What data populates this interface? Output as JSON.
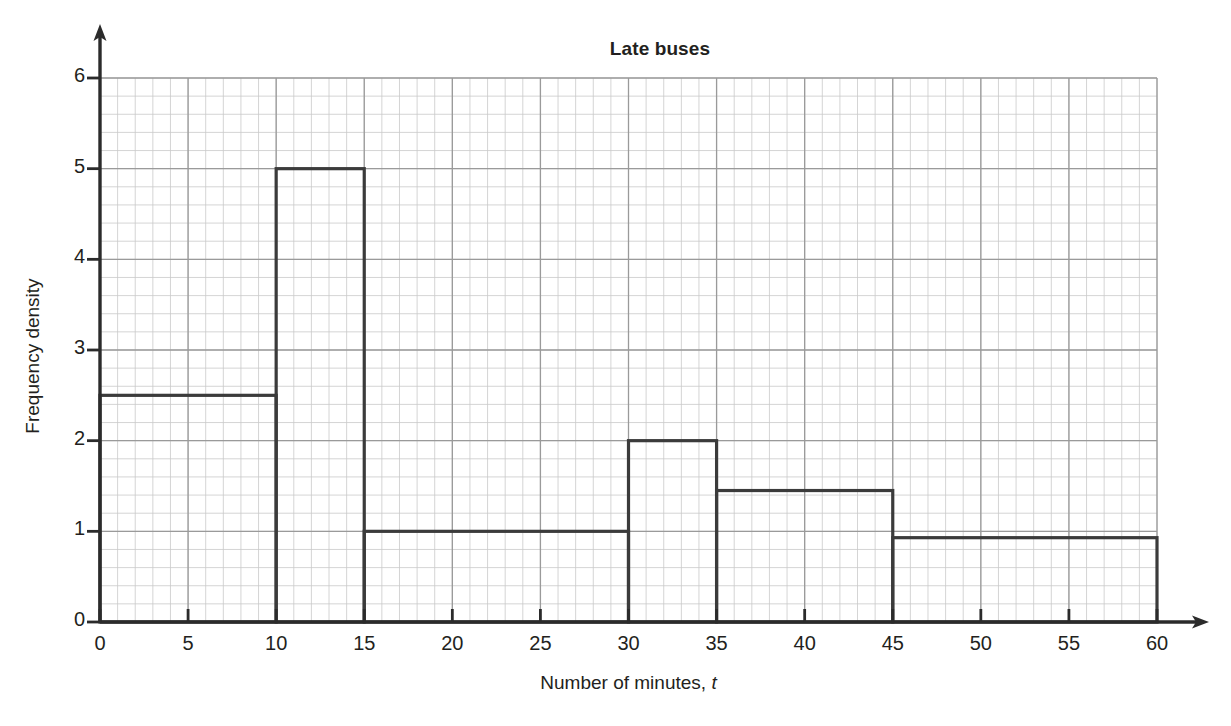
{
  "chart_data": {
    "type": "bar",
    "title": "Late buses",
    "xlabel": "Number of minutes, t",
    "xlabel_plain": "Number of minutes, ",
    "xlabel_variable": "t",
    "ylabel": "Frequency density",
    "xlim": [
      0,
      60
    ],
    "ylim": [
      0,
      6
    ],
    "x_ticks": [
      0,
      5,
      10,
      15,
      20,
      25,
      30,
      35,
      40,
      45,
      50,
      55,
      60
    ],
    "x_tick_labels": [
      "0",
      "5",
      "10",
      "15",
      "20",
      "25",
      "30",
      "35",
      "40",
      "45",
      "50",
      "55",
      "60"
    ],
    "y_ticks": [
      0,
      1,
      2,
      3,
      4,
      5,
      6
    ],
    "y_tick_labels": [
      "0",
      "1",
      "2",
      "3",
      "4",
      "5",
      "6"
    ],
    "grid": true,
    "grid_major_x_step": 5,
    "grid_major_y_step": 1,
    "grid_minor_x_step": 1,
    "grid_minor_y_step": 0.2,
    "legend": null,
    "bars": [
      {
        "label": "0 < t ≤ 10",
        "x_start": 0,
        "x_end": 10,
        "value": 2.5
      },
      {
        "label": "10 < t ≤ 15",
        "x_start": 10,
        "x_end": 15,
        "value": 5.0
      },
      {
        "label": "15 < t ≤ 30",
        "x_start": 15,
        "x_end": 30,
        "value": 1.0
      },
      {
        "label": "30 < t ≤ 35",
        "x_start": 30,
        "x_end": 35,
        "value": 2.0
      },
      {
        "label": "35 < t ≤ 45",
        "x_start": 35,
        "x_end": 45,
        "value": 1.45
      },
      {
        "label": "45 < t ≤ 60",
        "x_start": 45,
        "x_end": 60,
        "value": 0.93
      }
    ],
    "bar_fill": "none",
    "bar_outline_color": "#3b3b3b",
    "axis_color": "#2b2b2b",
    "grid_major_color": "#9a9a9a",
    "grid_minor_color": "#c9c9c9"
  }
}
